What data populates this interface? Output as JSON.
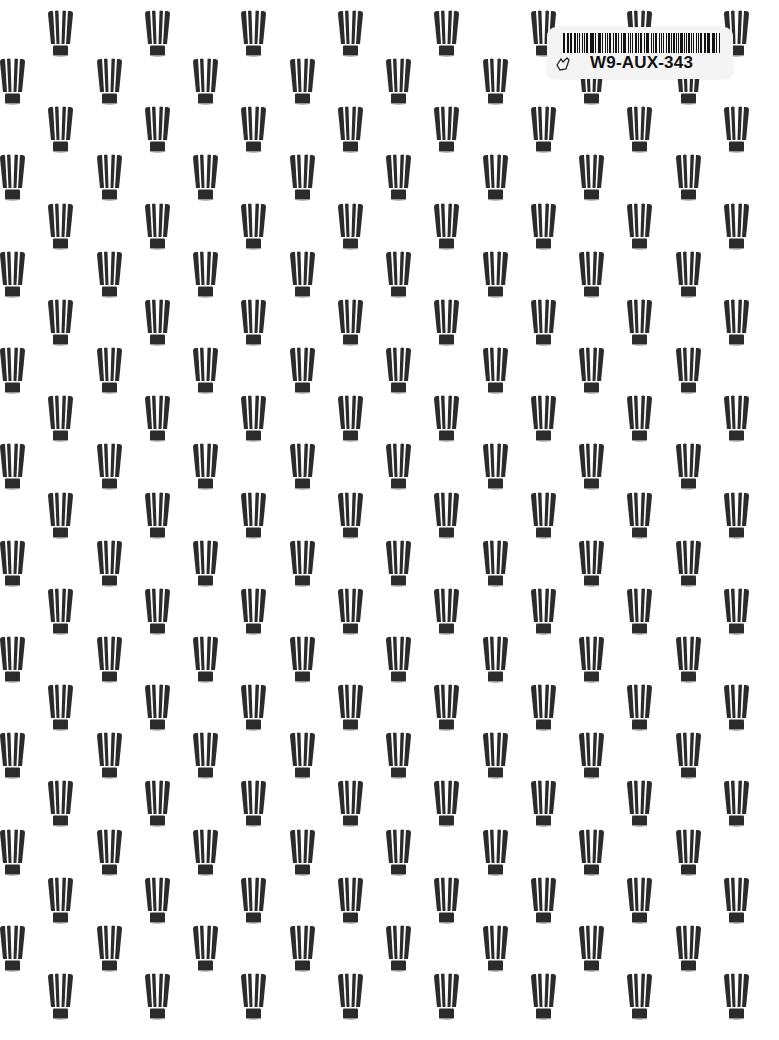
{
  "page": {
    "background_color": "#ffffff",
    "pattern": {
      "motif": "chef-hat-icon",
      "color": "#2b2b2b",
      "rows": 21,
      "row_spacing": 48.15,
      "first_row_top": 10,
      "col_spacing": 96.5,
      "odd_row_first_x": 47,
      "even_row_first_x": -1,
      "cols_per_row": 8
    }
  },
  "sticker": {
    "label_code": "W9-AUX-343",
    "icon": "hand-icon"
  }
}
